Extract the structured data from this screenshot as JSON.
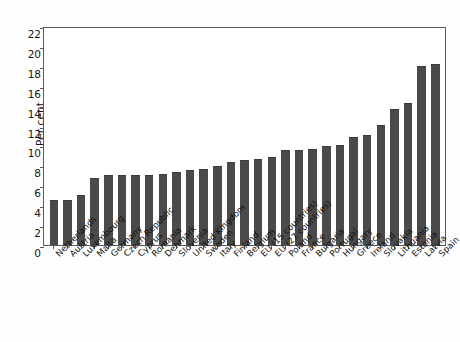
{
  "chart_data": {
    "type": "bar",
    "title": "",
    "subtitle": "",
    "xlabel": "",
    "ylabel": "Per cent",
    "ylim": [
      0,
      22
    ],
    "ytick_step": 2,
    "yticks": [
      0,
      2,
      4,
      6,
      8,
      10,
      12,
      14,
      16,
      18,
      20,
      22
    ],
    "grid": false,
    "legend": false,
    "bar_color": "#4a4a4a",
    "frame_color": "#5a5a5a",
    "categories": [
      "Netherlands",
      "Austria",
      "Luxembourg",
      "Malta",
      "Germany",
      "Czech Republic",
      "Cyprus",
      "Romania",
      "Denmark",
      "Slovenia",
      "United Kingdom",
      "Sweden",
      "Italy",
      "Finland",
      "Belgium",
      "EU (15 countries)",
      "EU (27 countries)",
      "Poland",
      "France",
      "Bulgaria",
      "Portugal",
      "Hungary",
      "Greece",
      "Ireland",
      "Slovakia",
      "Lithuania",
      "Estonia",
      "Latvia",
      "Spain"
    ],
    "values": [
      4.5,
      4.5,
      5.0,
      6.7,
      7.0,
      7.0,
      7.0,
      7.0,
      7.1,
      7.3,
      7.5,
      7.6,
      7.9,
      8.3,
      8.5,
      8.6,
      8.8,
      9.5,
      9.5,
      9.6,
      9.9,
      10.0,
      10.9,
      11.1,
      12.1,
      13.7,
      14.3,
      18.0,
      18.2
    ],
    "series": [
      {
        "name": "Unemployment rate",
        "values": [
          4.5,
          4.5,
          5.0,
          6.7,
          7.0,
          7.0,
          7.0,
          7.0,
          7.1,
          7.3,
          7.5,
          7.6,
          7.9,
          8.3,
          8.5,
          8.6,
          8.8,
          9.5,
          9.5,
          9.6,
          9.9,
          10.0,
          10.9,
          11.1,
          12.1,
          13.7,
          14.3,
          18.0,
          18.2
        ]
      }
    ]
  },
  "axis": {
    "y_title": "Per cent",
    "y_tick_labels": [
      "22",
      "20",
      "18",
      "16",
      "14",
      "12",
      "10",
      "8",
      "6",
      "4",
      "2",
      "0"
    ]
  },
  "bars": [
    {
      "label": "Netherlands",
      "value": 4.5
    },
    {
      "label": "Austria",
      "value": 4.5
    },
    {
      "label": "Luxembourg",
      "value": 5.0
    },
    {
      "label": "Malta",
      "value": 6.7
    },
    {
      "label": "Germany",
      "value": 7.0
    },
    {
      "label": "Czech Republic",
      "value": 7.0
    },
    {
      "label": "Cyprus",
      "value": 7.0
    },
    {
      "label": "Romania",
      "value": 7.0
    },
    {
      "label": "Denmark",
      "value": 7.1
    },
    {
      "label": "Slovenia",
      "value": 7.3
    },
    {
      "label": "United Kingdom",
      "value": 7.5
    },
    {
      "label": "Sweden",
      "value": 7.6
    },
    {
      "label": "Italy",
      "value": 7.9
    },
    {
      "label": "Finland",
      "value": 8.3
    },
    {
      "label": "Belgium",
      "value": 8.5
    },
    {
      "label": "EU (15 countries)",
      "value": 8.6
    },
    {
      "label": "EU (27 countries)",
      "value": 8.8
    },
    {
      "label": "Poland",
      "value": 9.5
    },
    {
      "label": "France",
      "value": 9.5
    },
    {
      "label": "Bulgaria",
      "value": 9.6
    },
    {
      "label": "Portugal",
      "value": 9.9
    },
    {
      "label": "Hungary",
      "value": 10.0
    },
    {
      "label": "Greece",
      "value": 10.9
    },
    {
      "label": "Ireland",
      "value": 11.1
    },
    {
      "label": "Slovakia",
      "value": 12.1
    },
    {
      "label": "Lithuania",
      "value": 13.7
    },
    {
      "label": "Estonia",
      "value": 14.3
    },
    {
      "label": "Latvia",
      "value": 18.0
    },
    {
      "label": "Spain",
      "value": 18.2
    }
  ]
}
